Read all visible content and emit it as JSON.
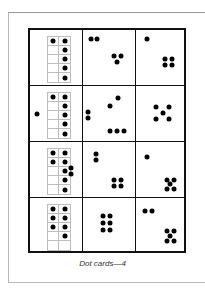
{
  "caption": "Dot cards—4",
  "grid": {
    "rows": 4,
    "cols": 3,
    "cells": [
      [
        {
          "type": "tenframe",
          "filled": [
            [
              0,
              0
            ],
            [
              0,
              1
            ],
            [
              1,
              1
            ],
            [
              2,
              1
            ],
            [
              3,
              1
            ],
            [
              4,
              1
            ]
          ],
          "extra_dots": [],
          "total": 6
        },
        {
          "type": "dots",
          "dots": [
            [
              8,
              9
            ],
            [
              14,
              9
            ],
            [
              31,
              26
            ],
            [
              38,
              26
            ],
            [
              34,
              32
            ]
          ],
          "total": 5
        },
        {
          "type": "dots",
          "dots": [
            [
              11,
              9
            ],
            [
              29,
              29
            ],
            [
              36,
              29
            ],
            [
              29,
              35
            ],
            [
              36,
              35
            ]
          ],
          "total": 5
        }
      ],
      [
        {
          "type": "tenframe",
          "filled": [
            [
              0,
              0
            ],
            [
              0,
              1
            ],
            [
              1,
              1
            ],
            [
              2,
              1
            ],
            [
              3,
              1
            ],
            [
              4,
              1
            ]
          ],
          "extra_dots": [
            [
              7,
              28
            ]
          ],
          "total": 7
        },
        {
          "type": "dots",
          "dots": [
            [
              35,
              12
            ],
            [
              27,
              20
            ],
            [
              5,
              26
            ],
            [
              5,
              32
            ],
            [
              27,
              45
            ],
            [
              34,
              45
            ],
            [
              41,
              45
            ]
          ],
          "total": 7
        },
        {
          "type": "dots",
          "dots": [
            [
              20,
              21
            ],
            [
              33,
              21
            ],
            [
              27,
              27
            ],
            [
              20,
              33
            ],
            [
              33,
              33
            ]
          ],
          "total": 5
        }
      ],
      [
        {
          "type": "tenframe",
          "filled": [
            [
              0,
              0
            ],
            [
              0,
              1
            ],
            [
              1,
              0
            ],
            [
              1,
              1
            ],
            [
              2,
              1
            ],
            [
              3,
              1
            ],
            [
              4,
              1
            ]
          ],
          "extra_dots": [
            [
              41,
              26
            ],
            [
              41,
              32
            ]
          ],
          "total": 9
        },
        {
          "type": "dots",
          "dots": [
            [
              13,
              12
            ],
            [
              13,
              18
            ],
            [
              31,
              38
            ],
            [
              38,
              38
            ],
            [
              31,
              44
            ],
            [
              38,
              44
            ]
          ],
          "total": 6
        },
        {
          "type": "dots",
          "dots": [
            [
              11,
              15
            ],
            [
              31,
              38
            ],
            [
              38,
              38
            ],
            [
              34,
              42
            ],
            [
              31,
              47
            ],
            [
              38,
              47
            ]
          ],
          "total": 6
        }
      ],
      [
        {
          "type": "tenframe",
          "filled": [
            [
              0,
              0
            ],
            [
              0,
              1
            ],
            [
              1,
              0
            ],
            [
              1,
              1
            ],
            [
              2,
              0
            ],
            [
              2,
              1
            ],
            [
              3,
              1
            ]
          ],
          "extra_dots": [],
          "total": 7
        },
        {
          "type": "dots",
          "dots": [
            [
              20,
              18
            ],
            [
              27,
              18
            ],
            [
              20,
              25
            ],
            [
              27,
              25
            ],
            [
              20,
              32
            ],
            [
              27,
              32
            ]
          ],
          "total": 6
        },
        {
          "type": "dots",
          "dots": [
            [
              9,
              13
            ],
            [
              16,
              13
            ],
            [
              31,
              33
            ],
            [
              38,
              33
            ],
            [
              34,
              38
            ],
            [
              31,
              43
            ],
            [
              38,
              43
            ]
          ],
          "total": 7
        }
      ]
    ]
  }
}
